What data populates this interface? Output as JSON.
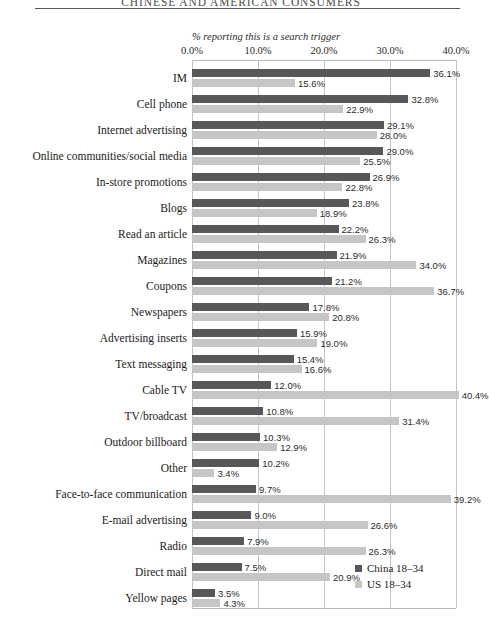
{
  "running_head": "CHINESE AND AMERICAN CONSUMERS",
  "legend": {
    "series": [
      {
        "label": "China 18–34",
        "color": "#58585a",
        "swatch_name": "legend-swatch-china"
      },
      {
        "label": "US 18–34",
        "color": "#c6c6c6",
        "swatch_name": "legend-swatch-us"
      }
    ]
  },
  "chart_data": {
    "type": "bar",
    "orientation": "horizontal",
    "title": "",
    "subtitle": "",
    "xlabel": "% reporting this is a search trigger",
    "ylabel": "",
    "xlim": [
      0,
      40
    ],
    "xticks": [
      "0.0%",
      "10.0%",
      "20.0%",
      "30.0%",
      "40.0%"
    ],
    "xtick_values": [
      0,
      10,
      20,
      30,
      40
    ],
    "grid": true,
    "legend_position": "bottom-right",
    "categories": [
      "IM",
      "Cell phone",
      "Internet advertising",
      "Online communities/social media",
      "In-store promotions",
      "Blogs",
      "Read an article",
      "Magazines",
      "Coupons",
      "Newspapers",
      "Advertising inserts",
      "Text messaging",
      "Cable TV",
      "TV/broadcast",
      "Outdoor billboard",
      "Other",
      "Face-to-face communication",
      "E-mail advertising",
      "Radio",
      "Direct mail",
      "Yellow pages"
    ],
    "series": [
      {
        "name": "China 18–34",
        "color": "#58585a",
        "values": [
          36.1,
          32.8,
          29.1,
          29.0,
          26.9,
          23.8,
          22.2,
          21.9,
          21.2,
          17.8,
          15.9,
          15.4,
          12.0,
          10.8,
          10.3,
          10.2,
          9.7,
          9.0,
          7.9,
          7.5,
          3.5
        ],
        "labels": [
          "36.1%",
          "32.8%",
          "29.1%",
          "29.0%",
          "26.9%",
          "23.8%",
          "22.2%",
          "21.9%",
          "21.2%",
          "17.8%",
          "15.9%",
          "15.4%",
          "12.0%",
          "10.8%",
          "10.3%",
          "10.2%",
          "9.7%",
          "9.0%",
          "7.9%",
          "7.5%",
          "3.5%"
        ]
      },
      {
        "name": "US 18–34",
        "color": "#c6c6c6",
        "values": [
          15.6,
          22.9,
          28.0,
          25.5,
          22.8,
          18.9,
          26.3,
          34.0,
          36.7,
          20.8,
          19.0,
          16.6,
          40.4,
          31.4,
          12.9,
          3.4,
          39.2,
          26.6,
          26.3,
          20.9,
          4.3
        ],
        "labels": [
          "15.6%",
          "22.9%",
          "28.0%",
          "25.5%",
          "22.8%",
          "18.9%",
          "26.3%",
          "34.0%",
          "36.7%",
          "20.8%",
          "19.0%",
          "16.6%",
          "40.4%",
          "31.4%",
          "12.9%",
          "3.4%",
          "39.2%",
          "26.6%",
          "26.3%",
          "20.9%",
          "4.3%"
        ]
      }
    ]
  }
}
